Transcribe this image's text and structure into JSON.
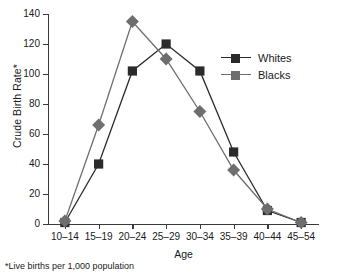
{
  "chart_data": {
    "type": "line",
    "title": "",
    "xlabel": "Age",
    "ylabel": "Crude Birth Rate*",
    "footnote": "*Live births per 1,000 population",
    "categories": [
      "10–14",
      "15–19",
      "20–24",
      "25–29",
      "30–34",
      "35–39",
      "40–44",
      "45–54"
    ],
    "yticks": [
      0,
      20,
      40,
      60,
      80,
      100,
      120,
      140
    ],
    "ylim": [
      0,
      140
    ],
    "grid": false,
    "legend_position": "right-top",
    "series": [
      {
        "name": "Whites",
        "color": "#2b2b2b",
        "marker": "square",
        "values": [
          1,
          40,
          102,
          120,
          102,
          48,
          9,
          1
        ]
      },
      {
        "name": "Blacks",
        "color": "#6e6e6e",
        "marker": "diamond",
        "values": [
          2,
          66,
          135,
          110,
          75,
          36,
          10,
          1
        ]
      }
    ]
  }
}
